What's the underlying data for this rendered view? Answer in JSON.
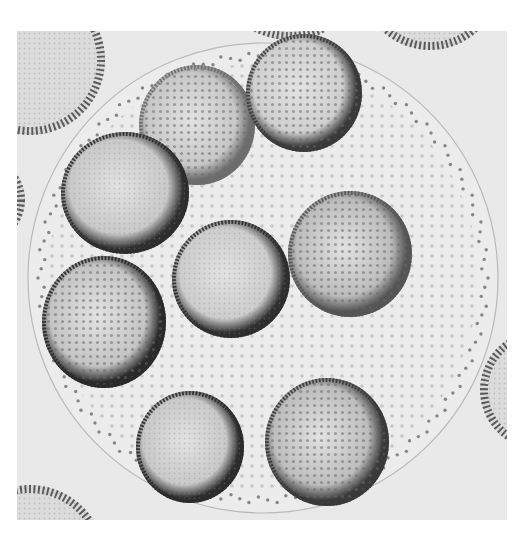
{
  "image": {
    "subject": "Volvox colony with daughter colonies (light micrograph, grayscale)",
    "frame": {
      "x": 17,
      "y": 31,
      "width": 490,
      "height": 489
    },
    "background_color": "#e9e9e9",
    "parent_colony": {
      "cx": 263,
      "cy": 278,
      "r": 235,
      "fill": "#ececec",
      "edge": "#b9b9b9"
    },
    "daughter_colonies": [
      {
        "id": "top-center",
        "cx": 197,
        "cy": 125,
        "rx": 58,
        "ry": 60,
        "rim": "#6d6d6d",
        "fill": "#c7c7c7",
        "pattern": "dots"
      },
      {
        "id": "top-right",
        "cx": 304,
        "cy": 93,
        "rx": 58,
        "ry": 59,
        "rim": "#3a3a3a",
        "fill": "#cfcfcf",
        "pattern": "dots"
      },
      {
        "id": "upper-left",
        "cx": 125,
        "cy": 193,
        "rx": 64,
        "ry": 61,
        "rim": "#2e2e2e",
        "fill": "#c9c9c9",
        "pattern": "smooth"
      },
      {
        "id": "center",
        "cx": 231,
        "cy": 279,
        "rx": 59,
        "ry": 59,
        "rim": "#2f2f2f",
        "fill": "#cdcdcd",
        "pattern": "smooth"
      },
      {
        "id": "right",
        "cx": 350,
        "cy": 254,
        "rx": 62,
        "ry": 63,
        "rim": "#555555",
        "fill": "#bcbcbc",
        "pattern": "dots"
      },
      {
        "id": "lower-left",
        "cx": 104,
        "cy": 322,
        "rx": 62,
        "ry": 66,
        "rim": "#2a2a2a",
        "fill": "#c4c4c4",
        "pattern": "dots"
      },
      {
        "id": "bottom-center",
        "cx": 190,
        "cy": 447,
        "rx": 54,
        "ry": 56,
        "rim": "#2c2c2c",
        "fill": "#c9c9c9",
        "pattern": "smooth"
      },
      {
        "id": "bottom-right",
        "cx": 327,
        "cy": 442,
        "rx": 62,
        "ry": 64,
        "rim": "#3a3a3a",
        "fill": "#bdbdbd",
        "pattern": "dots"
      }
    ],
    "neighbor_colonies": [
      {
        "id": "top-left-edge",
        "cx": 30,
        "cy": 60,
        "r": 75
      },
      {
        "id": "top-edge",
        "cx": 290,
        "cy": -40,
        "r": 80
      },
      {
        "id": "top-right-edge",
        "cx": 430,
        "cy": -20,
        "r": 70
      },
      {
        "id": "left-edge",
        "cx": -20,
        "cy": 200,
        "r": 45
      },
      {
        "id": "right-edge",
        "cx": 540,
        "cy": 390,
        "r": 60
      },
      {
        "id": "bottom-left-edge",
        "cx": 30,
        "cy": 560,
        "r": 75
      }
    ]
  }
}
